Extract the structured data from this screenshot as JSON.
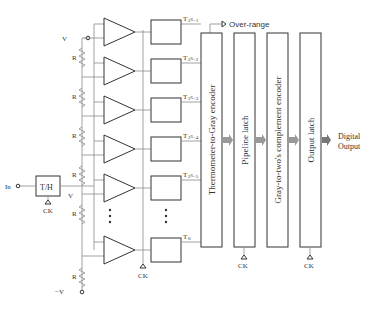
{
  "diagram": {
    "inputs": {
      "in_label": "In",
      "th_label": "T/H",
      "ck1": "CK",
      "ck1_sub": "1",
      "vi": "V",
      "vi_sub": "i",
      "vref_pos": "V",
      "vref_pos_sub": "REF",
      "vref_pos_suffix": "/2",
      "vref_neg": "−V",
      "vref_neg_sub": "REF",
      "vref_neg_suffix": "/2",
      "resistor": "R",
      "ck2": "CK",
      "ck2_sub": "2"
    },
    "comparator_outputs": [
      {
        "label": "T",
        "sub": "2ᴺ−1"
      },
      {
        "label": "T",
        "sub": "2ᴺ−2"
      },
      {
        "label": "T",
        "sub": "2ᴺ−3"
      },
      {
        "label": "T",
        "sub": "2ᴺ−4"
      },
      {
        "label": "T",
        "sub": "2ᴺ−5"
      },
      {
        "label": "T",
        "sub": "0"
      }
    ],
    "flipflop": {
      "d": "D",
      "q": "Q",
      "dbar": "D",
      "qbar": "Q"
    },
    "over_range": "Over-range",
    "blocks": [
      {
        "label": "Thermometer-to-Gray encoder"
      },
      {
        "label": "Pipeline latch",
        "clock": "CK",
        "clock_sub": "3"
      },
      {
        "label": "Gray-to-two's complement encoder"
      },
      {
        "label": "Output latch",
        "clock": "CK",
        "clock_sub": "4"
      }
    ],
    "output": {
      "line1": "Digital",
      "line2": "Output"
    }
  }
}
